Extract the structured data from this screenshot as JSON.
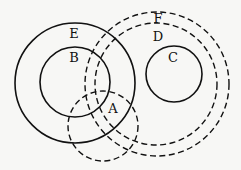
{
  "diagram": {
    "type": "venn-set-relationship",
    "circles": [
      {
        "id": "E",
        "label": "E",
        "style": "solid",
        "cx": 75,
        "cy": 83,
        "r": 60,
        "label_x": 74,
        "label_y": 38
      },
      {
        "id": "B",
        "label": "B",
        "style": "solid",
        "cx": 75,
        "cy": 82,
        "r": 35,
        "label_x": 74,
        "label_y": 62
      },
      {
        "id": "C",
        "label": "C",
        "style": "solid",
        "cx": 174,
        "cy": 74,
        "r": 28,
        "label_x": 173,
        "label_y": 62
      },
      {
        "id": "A",
        "label": "A",
        "style": "dashed",
        "cx": 103,
        "cy": 126,
        "r": 35,
        "label_x": 113,
        "label_y": 113
      },
      {
        "id": "D",
        "label": "D",
        "style": "dashed",
        "cx": 156,
        "cy": 84,
        "r": 61,
        "label_x": 158,
        "label_y": 41
      },
      {
        "id": "F",
        "label": "F",
        "style": "dashed",
        "cx": 157,
        "cy": 84,
        "r": 72,
        "label_x": 158,
        "label_y": 23
      }
    ]
  }
}
